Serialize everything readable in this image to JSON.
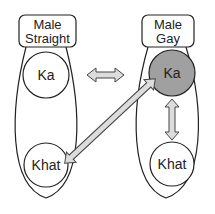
{
  "diagram": {
    "groups": [
      {
        "id": "straight",
        "title_line1": "Male",
        "title_line2": "Straight"
      },
      {
        "id": "gay",
        "title_line1": "Male",
        "title_line2": "Gay"
      }
    ],
    "nodes": {
      "straight_ka": {
        "label": "Ka",
        "fill": "#ffffff"
      },
      "straight_khat": {
        "label": "Khat",
        "fill": "#ffffff"
      },
      "gay_ka": {
        "label": "Ka",
        "fill": "#a0a0a0"
      },
      "gay_khat": {
        "label": "Khat",
        "fill": "#ffffff"
      }
    },
    "arrows": [
      {
        "from": "straight_ka",
        "to": "gay_ka",
        "style": "double"
      },
      {
        "from": "gay_ka",
        "to": "straight_khat",
        "style": "double"
      },
      {
        "from": "gay_ka",
        "to": "gay_khat",
        "style": "double"
      }
    ],
    "colors": {
      "stroke": "#222222",
      "arrow_fill": "#dcdcdc",
      "highlight": "#a0a0a0"
    }
  }
}
